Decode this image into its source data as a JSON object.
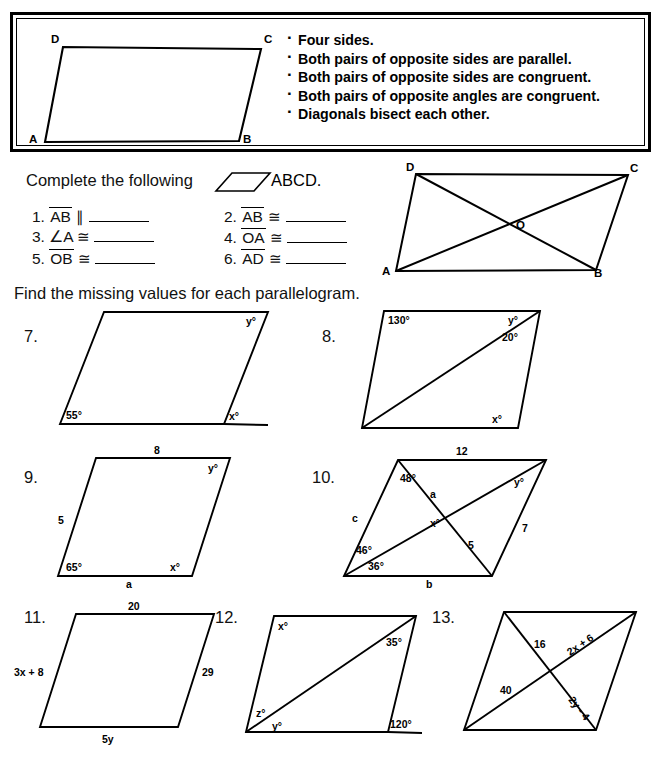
{
  "factbox": {
    "figure_labels": [
      "D",
      "C",
      "A",
      "B"
    ],
    "facts": [
      "Four sides.",
      "Both pairs of opposite sides are parallel.",
      "Both pairs of opposite sides are congruent.",
      "Both pairs of opposite angles are congruent.",
      "Diagonals bisect each other."
    ]
  },
  "instructions": {
    "complete": "Complete the following",
    "abcd": "ABCD.",
    "find": "Find the missing values for each parallelogram."
  },
  "questions": [
    {
      "num": "1.",
      "seg": "AB",
      "rel": "∥",
      "blank": true
    },
    {
      "num": "2.",
      "seg": "AB",
      "rel": "≅",
      "blank": true
    },
    {
      "num": "3.",
      "seg": "∠A",
      "rel": "≅",
      "blank": true
    },
    {
      "num": "4.",
      "seg": "OA",
      "rel": "≅",
      "blank": true
    },
    {
      "num": "5.",
      "seg": "OB",
      "rel": "≅",
      "blank": true
    },
    {
      "num": "6.",
      "seg": "AD",
      "rel": "≅",
      "blank": true
    }
  ],
  "diagonal_figure": {
    "labels": [
      "D",
      "C",
      "A",
      "B",
      "O"
    ]
  },
  "problems": [
    {
      "num": "7.",
      "labels": {
        "bottom_left_angle": "55°",
        "top_right_angle": "y°",
        "exterior_angle": "x°"
      }
    },
    {
      "num": "8.",
      "labels": {
        "top_left_angle": "130°",
        "top_right_upper": "y°",
        "top_right_lower": "20°",
        "bottom_right_angle": "x°"
      }
    },
    {
      "num": "9.",
      "labels": {
        "top_side": "8",
        "left_side": "5",
        "bottom_side": "a",
        "bottom_left_angle": "65°",
        "bottom_right_angle": "x°",
        "top_right_angle": "y°"
      }
    },
    {
      "num": "10.",
      "labels": {
        "top_side": "12",
        "left_side": "c",
        "right_side": "7",
        "bottom_side": "b",
        "top_left_angle": "48°",
        "diag_upper": "a",
        "center_angle": "x°",
        "diag_lower": "5",
        "bottom_left_upper": "46°",
        "bottom_left_lower": "36°",
        "top_right_angle": "y°"
      }
    },
    {
      "num": "11.",
      "labels": {
        "top_side": "20",
        "left_side": "3x + 8",
        "right_side": "29",
        "bottom_side": "5y"
      }
    },
    {
      "num": "12.",
      "labels": {
        "top_left_angle": "x°",
        "top_right_angle": "35°",
        "bottom_left_upper": "z°",
        "bottom_left_lower": "y°",
        "exterior_angle": "120°"
      }
    },
    {
      "num": "13.",
      "labels": {
        "diag_upper_left": "16",
        "diag_upper_right": "2x + 6",
        "diag_lower_left": "40",
        "diag_lower_right": "2y - 4"
      }
    }
  ]
}
